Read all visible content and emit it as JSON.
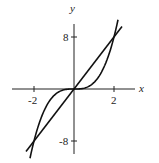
{
  "chart_data": {
    "type": "line",
    "title": "",
    "xlabel": "x",
    "ylabel": "y",
    "xlim": [
      -3,
      3
    ],
    "ylim": [
      -10,
      10
    ],
    "grid": false,
    "x_ticks": [
      -2,
      2
    ],
    "x_tick_labels": [
      "-2",
      "2"
    ],
    "y_ticks": [
      8,
      -8
    ],
    "y_tick_labels": [
      "8",
      "-8"
    ],
    "series": [
      {
        "name": "y = 4x",
        "x": [
          -2.4,
          -2,
          0,
          2,
          2.4
        ],
        "y": [
          -9.6,
          -8,
          0,
          8,
          9.6
        ]
      },
      {
        "name": "y = x^3",
        "x": [
          -2.2,
          -2,
          -1,
          0,
          1,
          2,
          2.2
        ],
        "y": [
          -10.6,
          -8,
          -1,
          0,
          1,
          8,
          10.6
        ]
      }
    ],
    "intersections": [
      [
        -2,
        -8
      ],
      [
        0,
        0
      ],
      [
        2,
        8
      ]
    ]
  },
  "labels": {
    "x_axis": "x",
    "y_axis": "y",
    "tick_x_neg": "-2",
    "tick_x_pos": "2",
    "tick_y_pos": "8",
    "tick_y_neg": "-8"
  }
}
